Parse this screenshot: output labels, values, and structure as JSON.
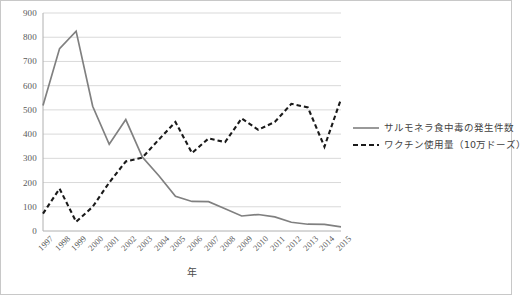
{
  "chart_data": {
    "type": "line",
    "title": "",
    "subtitle": "",
    "xlabel": "年",
    "ylabel": "",
    "ylim": [
      0,
      900
    ],
    "ytick_step": 100,
    "yticks": [
      900,
      800,
      700,
      600,
      500,
      400,
      300,
      200,
      100,
      0
    ],
    "grid": "horizontal",
    "legend_position": "right",
    "categories": [
      "1997",
      "1998",
      "1999",
      "2000",
      "2001",
      "2002",
      "2003",
      "2004",
      "2005",
      "2006",
      "2007",
      "2008",
      "2009",
      "2010",
      "2011",
      "2012",
      "2013",
      "2014",
      "2015"
    ],
    "series": [
      {
        "name": "サルモネラ食中毒の発生件数",
        "style": "solid",
        "color": "#808080",
        "values": [
          518,
          753,
          825,
          515,
          358,
          460,
          305,
          228,
          143,
          122,
          121,
          92,
          62,
          68,
          58,
          36,
          28,
          27,
          17
        ]
      },
      {
        "name": "ワクチン使用量（10万ドーズ）",
        "style": "dashed",
        "color": "#1a1a1a",
        "values": [
          72,
          175,
          38,
          100,
          200,
          287,
          303,
          378,
          450,
          322,
          382,
          367,
          465,
          418,
          450,
          525,
          510,
          348,
          545
        ]
      }
    ]
  },
  "axis": {
    "x_title": "年"
  },
  "legend": {
    "items": [
      {
        "label": "サルモネラ食中毒の発生件数",
        "style": "solid",
        "color": "#808080"
      },
      {
        "label": "ワクチン使用量（10万ドーズ）",
        "style": "dashed",
        "color": "#1a1a1a"
      }
    ]
  },
  "colors": {
    "grid": "#d9d9d9",
    "axis": "#b0b0b0",
    "series_solid": "#808080",
    "series_dashed": "#1a1a1a",
    "text": "#595959",
    "background": "#ffffff"
  }
}
